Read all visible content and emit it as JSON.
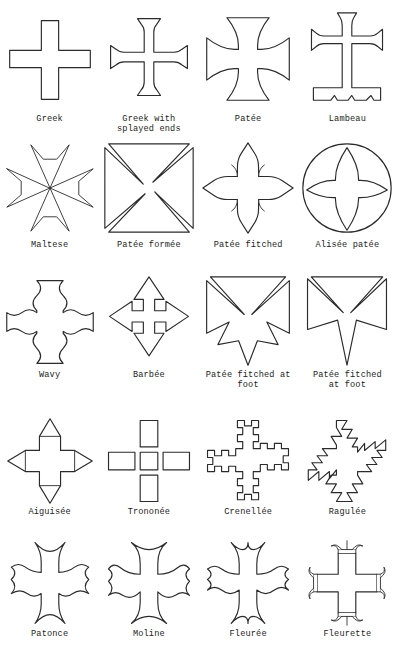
{
  "page": {
    "background_color": "#ffffff",
    "ink_color": "#2b2b2b",
    "columns": 4,
    "rows": 5
  },
  "figures": [
    {
      "id": "greek",
      "label": "Greek",
      "row": 1,
      "col": 1
    },
    {
      "id": "greek-splayed-ends",
      "label": "Greek with\nsplayed ends",
      "row": 1,
      "col": 2
    },
    {
      "id": "patee",
      "label": "Patée",
      "row": 1,
      "col": 3
    },
    {
      "id": "lambeau",
      "label": "Lambeau",
      "row": 1,
      "col": 4
    },
    {
      "id": "maltese",
      "label": "Maltese",
      "row": 2,
      "col": 1
    },
    {
      "id": "patee-formee",
      "label": "Patée formée",
      "row": 2,
      "col": 2
    },
    {
      "id": "patee-fitched",
      "label": "Patée fitched",
      "row": 2,
      "col": 3
    },
    {
      "id": "alisee-patee",
      "label": "Alisée patée",
      "row": 2,
      "col": 4
    },
    {
      "id": "wavy",
      "label": "Wavy",
      "row": 3,
      "col": 1
    },
    {
      "id": "barbee",
      "label": "Barbée",
      "row": 3,
      "col": 2
    },
    {
      "id": "patee-fitched-at-foot-a",
      "label": "Patée fitched at\nfoot",
      "row": 3,
      "col": 3
    },
    {
      "id": "patee-fitched-at-foot-b",
      "label": "Patée fitched\nat foot",
      "row": 3,
      "col": 4
    },
    {
      "id": "aiguisee",
      "label": "Aiguisée",
      "row": 4,
      "col": 1
    },
    {
      "id": "trononee",
      "label": "Trononée",
      "row": 4,
      "col": 2
    },
    {
      "id": "crenellee",
      "label": "Crenellée",
      "row": 4,
      "col": 3
    },
    {
      "id": "ragulee",
      "label": "Ragulée",
      "row": 4,
      "col": 4
    },
    {
      "id": "patonce",
      "label": "Patonce",
      "row": 5,
      "col": 1
    },
    {
      "id": "moline",
      "label": "Moline",
      "row": 5,
      "col": 2
    },
    {
      "id": "fleuree",
      "label": "Fleurée",
      "row": 5,
      "col": 3
    },
    {
      "id": "fleurette",
      "label": "Fleurette",
      "row": 5,
      "col": 4
    }
  ]
}
